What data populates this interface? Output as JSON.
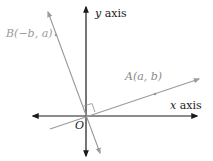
{
  "diagram": {
    "axes": {
      "x_label_var": "x",
      "x_label_word": " axis",
      "y_label_var": "y",
      "y_label_word": " axis",
      "origin_label": "O",
      "axis_color": "#1a1a1a"
    },
    "points": {
      "A": {
        "label": "A(a, b)",
        "name": "A",
        "coords": "(a, b)"
      },
      "B": {
        "label": "B(−b, a)",
        "name": "B",
        "coords": "(−b, a)"
      }
    },
    "line_color": "#9a9a9a",
    "right_angle_marker": true
  }
}
